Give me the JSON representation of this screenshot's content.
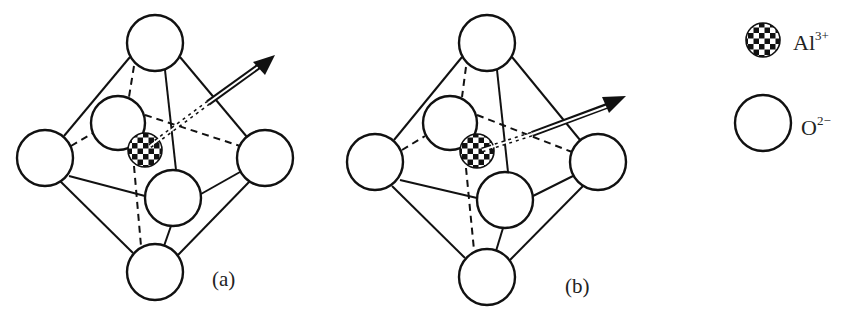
{
  "figure": {
    "panels": [
      {
        "id": "a",
        "label": "(a)"
      },
      {
        "id": "b",
        "label": "(b)"
      }
    ],
    "legend": {
      "items": [
        {
          "symbol": "checkered-circle",
          "element": "Al",
          "charge": "3+"
        },
        {
          "symbol": "open-circle",
          "element": "O",
          "charge": "2−"
        }
      ]
    },
    "colors": {
      "stroke": "#111111",
      "background": "#ffffff",
      "checker_dark": "#111111",
      "checker_light": "#ffffff"
    }
  }
}
